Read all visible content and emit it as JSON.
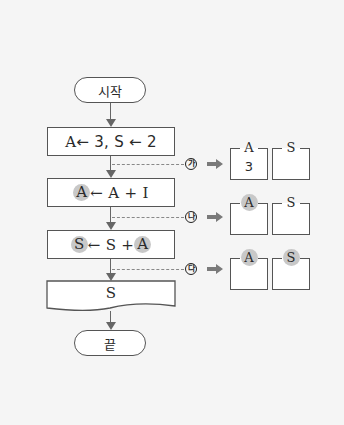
{
  "flowchart": {
    "start": "시작",
    "end": "끝",
    "steps": [
      {
        "id": "init",
        "text_parts": [
          "A",
          " ← 3, S ← 2"
        ],
        "highlight": []
      },
      {
        "id": "incA",
        "text_parts": [
          "A",
          " ← A + I"
        ],
        "highlight": [
          "A"
        ]
      },
      {
        "id": "sumS",
        "text_parts": [
          "S",
          " ← S + ",
          "A"
        ],
        "highlight": [
          "S",
          "A"
        ]
      },
      {
        "id": "output",
        "text": "S",
        "shape": "document"
      }
    ],
    "checkpoints": [
      {
        "label": "가",
        "A_label": "A",
        "S_label": "S",
        "A_value": "3",
        "S_value": "",
        "A_highlight": false,
        "S_highlight": false
      },
      {
        "label": "나",
        "A_label": "A",
        "S_label": "S",
        "A_value": "",
        "S_value": "",
        "A_highlight": true,
        "S_highlight": false
      },
      {
        "label": "다",
        "A_label": "A",
        "S_label": "S",
        "A_value": "",
        "S_value": "",
        "A_highlight": true,
        "S_highlight": true
      }
    ]
  },
  "colors": {
    "background": "#f5f5f5",
    "highlight": "#c8c8c8",
    "line": "#555555",
    "arrow_fill": "#7a7a7a"
  }
}
